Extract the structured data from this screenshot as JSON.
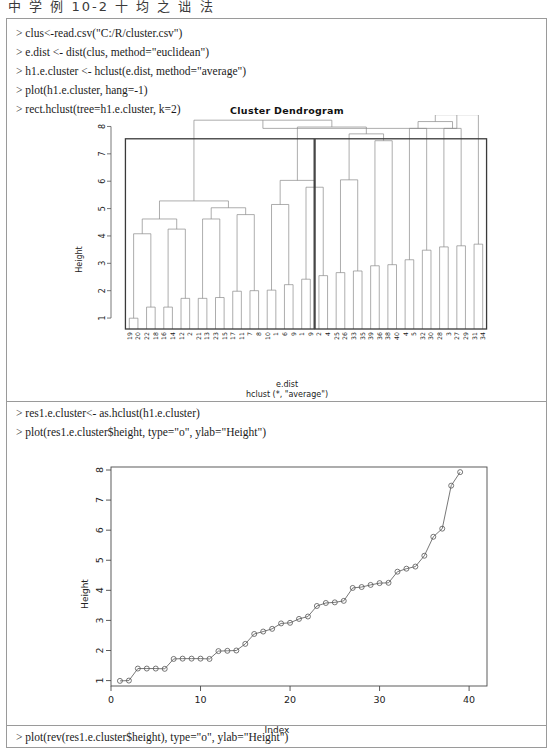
{
  "page_header": "中 学 例 10-2    十 均 之 诎 法",
  "console_lines_top": [
    "> clus<-read.csv(\"C:/R/cluster.csv\")",
    "> e.dist <- dist(clus, method=\"euclidean\")",
    "> h1.e.cluster <- hclust(e.dist, method=\"average\")",
    "> plot(h1.e.cluster, hang=-1)",
    "> rect.hclust(tree=h1.e.cluster, k=2)"
  ],
  "console_lines_mid": [
    "> res1.e.cluster<- as.hclust(h1.e.cluster)",
    "> plot(res1.e.cluster$height, type=\"o\", ylab=\"Height\")"
  ],
  "console_lines_bottom": [
    "> plot(rev(res1.e.cluster$height), type=\"o\", ylab=\"Height\")"
  ],
  "chart_data": [
    {
      "type": "dendrogram",
      "title": "Cluster Dendrogram",
      "xlabel": "e.dist",
      "sublabel": "hclust (*, \"average\")",
      "ylabel": "Height",
      "ylim": [
        0.6,
        8.2
      ],
      "yticks": [
        1,
        2,
        3,
        4,
        5,
        6,
        7,
        8
      ],
      "grid": false,
      "method": "average",
      "distance": "euclidean",
      "k_rectangles": 2,
      "rect_color": "#3a3a3a",
      "line_color": "#8a8a8a",
      "leaf_labels": [
        "19",
        "20",
        "22",
        "18",
        "16",
        "14",
        "12",
        "2",
        "21",
        "13",
        "23",
        "15",
        "17",
        "11",
        "7",
        "8",
        "10",
        "1",
        "6",
        "9",
        "1",
        "9",
        "2",
        "4",
        "25",
        "26",
        "33",
        "35",
        "39",
        "36",
        "38",
        "40",
        "4",
        "5",
        "32",
        "30",
        "28",
        "3",
        "27",
        "29",
        "31",
        "34"
      ],
      "merges": [
        {
          "height": 0.995,
          "left": "19",
          "right": "20"
        },
        {
          "height": 1.4,
          "left": "22",
          "right": "18"
        },
        {
          "height": 1.4,
          "left": "16",
          "right": "14"
        },
        {
          "height": 1.72,
          "left": "12",
          "right": "2"
        },
        {
          "height": 1.72,
          "left": "21",
          "right": "13"
        },
        {
          "height": 1.75,
          "left": "23",
          "right": "15"
        },
        {
          "height": 1.98,
          "left": "17",
          "right": "11"
        },
        {
          "height": 2.0,
          "left": "7",
          "right": "8"
        },
        {
          "height": 2.02,
          "left": "10",
          "right": "1"
        },
        {
          "height": 2.22,
          "left": "6",
          "right": "9"
        },
        {
          "height": 2.55,
          "left": "25",
          "right": "26"
        },
        {
          "height": 2.66,
          "left": "33",
          "right": "35"
        },
        {
          "height": 2.72,
          "left": "39",
          "right": "36"
        },
        {
          "height": 2.91,
          "left": "38",
          "right": "40"
        },
        {
          "height": 2.95,
          "left": "4",
          "right": "5"
        },
        {
          "height": 3.13,
          "left": "32",
          "right": "30"
        },
        {
          "height": 3.48,
          "left": "28",
          "right": "3"
        },
        {
          "height": 3.6,
          "left": "27",
          "right": "29"
        },
        {
          "height": 3.64,
          "left": "31",
          "right": "34"
        },
        {
          "height": 4.08,
          "left": "c1",
          "right": "c2"
        },
        {
          "height": 4.25,
          "left": "c3",
          "right": "c4"
        },
        {
          "height": 4.62,
          "left": "c5",
          "right": "c6"
        },
        {
          "height": 4.78,
          "left": "c7",
          "right": "c8"
        },
        {
          "height": 5.15,
          "left": "c9",
          "right": "c10"
        },
        {
          "height": 5.78,
          "left": "c11",
          "right": "c12"
        },
        {
          "height": 6.05,
          "left": "c13",
          "right": "c14"
        },
        {
          "height": 7.48,
          "left": "c15",
          "right": "c16"
        },
        {
          "height": 7.93,
          "left": "L",
          "right": "R"
        }
      ]
    },
    {
      "type": "line",
      "title": "",
      "xlabel": "Index",
      "ylabel": "Height",
      "xlim": [
        0,
        42
      ],
      "ylim": [
        0.82,
        8.1
      ],
      "xticks": [
        0,
        10,
        20,
        30,
        40
      ],
      "yticks": [
        1,
        2,
        3,
        4,
        5,
        6,
        7,
        8
      ],
      "grid": false,
      "marker": "open-circle",
      "line_color": "#555555",
      "x": [
        1,
        2,
        3,
        4,
        5,
        6,
        7,
        8,
        9,
        10,
        11,
        12,
        13,
        14,
        15,
        16,
        17,
        18,
        19,
        20,
        21,
        22,
        23,
        24,
        25,
        26,
        27,
        28,
        29,
        30,
        31,
        32,
        33,
        34,
        35,
        36,
        37,
        38,
        39
      ],
      "values": [
        0.99,
        1.0,
        1.4,
        1.4,
        1.4,
        1.39,
        1.72,
        1.73,
        1.73,
        1.73,
        1.72,
        1.98,
        1.99,
        2.0,
        2.22,
        2.55,
        2.63,
        2.72,
        2.9,
        2.92,
        3.05,
        3.13,
        3.48,
        3.58,
        3.6,
        3.65,
        4.08,
        4.11,
        4.18,
        4.24,
        4.25,
        4.62,
        4.72,
        4.79,
        5.15,
        5.78,
        6.05,
        7.48,
        7.93
      ]
    }
  ]
}
